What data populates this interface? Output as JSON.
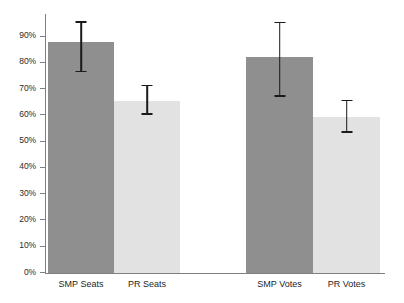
{
  "chart_data": {
    "type": "bar",
    "title": "",
    "subtitle": "",
    "xlabel": "",
    "ylabel": "",
    "categories": [
      "SMP Seats",
      "PR Seats",
      "SMP Votes",
      "PR Votes"
    ],
    "values": [
      87.7,
      65.3,
      82.0,
      59.2
    ],
    "error_low": [
      76.2,
      60.0,
      66.8,
      53.1
    ],
    "error_high": [
      95.7,
      71.4,
      95.4,
      65.7
    ],
    "series": [
      {
        "name": "Proportion",
        "values": [
          87.7,
          65.3,
          82.0,
          59.2
        ]
      }
    ],
    "groups": [
      {
        "name": "Seats",
        "categories": [
          "SMP Seats",
          "PR Seats"
        ]
      },
      {
        "name": "Votes",
        "categories": [
          "SMP Votes",
          "PR Votes"
        ]
      }
    ],
    "ylim": [
      0,
      95
    ],
    "yticks": [
      0,
      10,
      20,
      30,
      40,
      50,
      60,
      70,
      80,
      90
    ],
    "ytick_labels": [
      "0%",
      "10%",
      "20%",
      "30%",
      "40%",
      "50%",
      "60%",
      "70%",
      "80%",
      "90%"
    ],
    "grid": false,
    "legend": "none",
    "bar_colors": [
      "#8f8f8f",
      "#e2e2e2",
      "#8f8f8f",
      "#e2e2e2"
    ],
    "error_bar_color": "#1a1a1a",
    "axis_color": "#808080"
  },
  "axis": {
    "ticks": [
      {
        "label": "90%",
        "value": 90
      },
      {
        "label": "80%",
        "value": 80
      },
      {
        "label": "70%",
        "value": 70
      },
      {
        "label": "60%",
        "value": 60
      },
      {
        "label": "50%",
        "value": 50
      },
      {
        "label": "40%",
        "value": 40
      },
      {
        "label": "30%",
        "value": 30
      },
      {
        "label": "20%",
        "value": 20
      },
      {
        "label": "10%",
        "value": 10
      },
      {
        "label": "0%",
        "value": 0
      }
    ]
  },
  "bars": [
    {
      "label": "SMP Seats",
      "value": 87.7,
      "low": 76.2,
      "high": 95.7,
      "shade": "dark"
    },
    {
      "label": "PR Seats",
      "value": 65.3,
      "low": 60.0,
      "high": 71.4,
      "shade": "light"
    },
    {
      "label": "SMP Votes",
      "value": 82.0,
      "low": 66.8,
      "high": 95.4,
      "shade": "dark"
    },
    {
      "label": "PR Votes",
      "value": 59.2,
      "low": 53.1,
      "high": 65.7,
      "shade": "light"
    }
  ]
}
